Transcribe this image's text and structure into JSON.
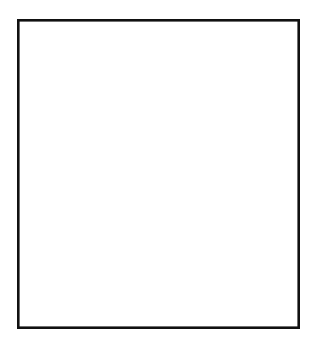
{
  "meta": {
    "style": "black ink line art on white",
    "canvas": {
      "width": 320,
      "height": 354
    },
    "line_color": "#1a1a1a",
    "background_color": "#ffffff"
  },
  "frame": {
    "label": "picture-border",
    "x": 17,
    "y": 19,
    "width": 283,
    "height": 310,
    "stroke_width": 2.6,
    "stroke_color": "#111111"
  },
  "vanishing_point": {
    "x": 300,
    "y": 161,
    "label": "vanishing point at right border"
  },
  "scene": {
    "sky_wires_label": "telegraph wires converging to vanishing point",
    "track_label": "railroad track with ties",
    "poles_label": "three telegraph poles"
  },
  "wires": {
    "description": "Straight lines radiating from the vanishing point toward the upper-left, left and lower-left.",
    "count": 13,
    "endpoints": [
      {
        "id": "wire-01",
        "x": 40,
        "y": 19,
        "edge": "top"
      },
      {
        "id": "wire-02",
        "x": 138,
        "y": 19,
        "edge": "top"
      },
      {
        "id": "wire-03",
        "x": 183,
        "y": 19,
        "edge": "top"
      },
      {
        "id": "wire-04",
        "x": 214,
        "y": 19,
        "edge": "top"
      },
      {
        "id": "wire-05",
        "x": 240,
        "y": 19,
        "edge": "top"
      },
      {
        "id": "wire-06",
        "x": 261,
        "y": 19,
        "edge": "top"
      },
      {
        "id": "wire-07",
        "x": 279,
        "y": 19,
        "edge": "top"
      },
      {
        "id": "wire-08",
        "x": 17,
        "y": 105,
        "edge": "left"
      },
      {
        "id": "wire-09",
        "x": 17,
        "y": 114,
        "edge": "left"
      },
      {
        "id": "wire-10",
        "x": 17,
        "y": 212,
        "edge": "left"
      },
      {
        "id": "wire-11",
        "x": 17,
        "y": 232,
        "edge": "left"
      },
      {
        "id": "wire-12",
        "x": 17,
        "y": 285,
        "edge": "left"
      },
      {
        "id": "wire-13",
        "x": 17,
        "y": 322,
        "edge": "left"
      }
    ]
  },
  "track": {
    "description": "Two rails and an embankment edge running from lower-left toward the vanishing point, crossed by ties.",
    "rails": [
      {
        "id": "rail-near-outer",
        "from": {
          "x": 90,
          "y": 329
        },
        "to": {
          "x": 300,
          "y": 168
        }
      },
      {
        "id": "rail-near-inner",
        "from": {
          "x": 108,
          "y": 329
        },
        "to": {
          "x": 300,
          "y": 172
        }
      },
      {
        "id": "rail-far-outer",
        "from": {
          "x": 132,
          "y": 329
        },
        "to": {
          "x": 300,
          "y": 176
        }
      }
    ],
    "ties": {
      "count": 12,
      "label": "railroad ties / sleepers"
    }
  },
  "poles": [
    {
      "id": "pole-front",
      "label": "front telegraph pole",
      "x": 108,
      "top_y": 222,
      "bottom_y": 302,
      "width": 6,
      "crossarm_groups": 2,
      "crossarms_per_group": 2,
      "crossarm_half_width": 30
    },
    {
      "id": "pole-middle",
      "label": "middle telegraph pole",
      "x": 162,
      "top_y": 179,
      "bottom_y": 272,
      "width": 6,
      "crossarm_groups": 2,
      "crossarms_per_group": 2,
      "crossarm_half_width": 38
    },
    {
      "id": "pole-rear",
      "label": "rear telegraph pole",
      "x": 225,
      "top_y": 132,
      "bottom_y": 250,
      "width": 7,
      "crossarm_groups": 2,
      "crossarms_per_group": 2,
      "crossarm_half_width": 44
    }
  ]
}
